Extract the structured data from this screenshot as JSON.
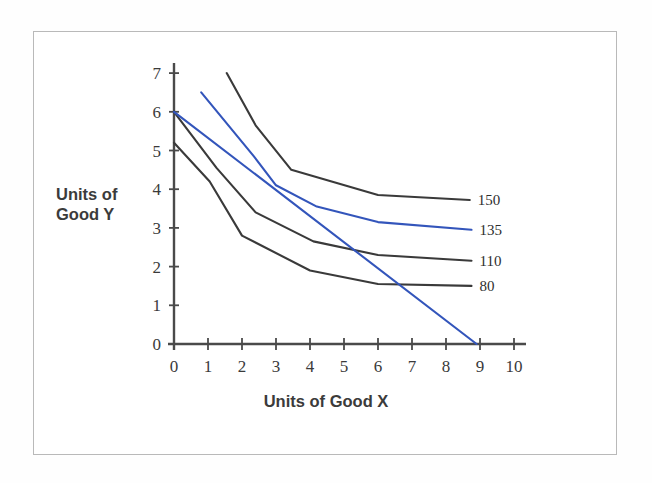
{
  "figure": {
    "background_color": "#ffffff",
    "frame_border_color": "#b9b9b9"
  },
  "chart_data": {
    "type": "line",
    "title": "",
    "xlabel": "Units of Good X",
    "ylabel": "Units of Good Y",
    "xlim": [
      0,
      10
    ],
    "ylim": [
      0,
      7
    ],
    "xticks": [
      0,
      1,
      2,
      3,
      4,
      5,
      6,
      7,
      8,
      9,
      10
    ],
    "xticklabels": [
      "0",
      "1",
      "2",
      "3",
      "4",
      "5",
      "6",
      "7",
      "8",
      "9",
      "10"
    ],
    "yticks": [
      0,
      1,
      2,
      3,
      4,
      5,
      6,
      7
    ],
    "yticklabels": [
      "0",
      "1",
      "2",
      "3",
      "4",
      "5",
      "6",
      "7"
    ],
    "grid": false,
    "legend_position": "right-of-curve-ends",
    "axis_color": "#4a4a4a",
    "series": [
      {
        "name": "150",
        "label": "150",
        "kind": "indifference-curve",
        "color": "#3a3a3a",
        "label_x": 9.0,
        "label_y": 3.85,
        "points": [
          [
            1.55,
            7.0
          ],
          [
            2.4,
            5.65
          ],
          [
            3.45,
            4.5
          ],
          [
            6.0,
            3.85
          ],
          [
            8.7,
            3.72
          ]
        ]
      },
      {
        "name": "135",
        "label": "135",
        "kind": "indifference-curve",
        "color": "#3355bb",
        "label_x": 9.0,
        "label_y": 3.0,
        "points": [
          [
            0.8,
            6.5
          ],
          [
            2.35,
            4.85
          ],
          [
            3.0,
            4.1
          ],
          [
            4.2,
            3.55
          ],
          [
            6.0,
            3.15
          ],
          [
            8.75,
            2.95
          ]
        ]
      },
      {
        "name": "110",
        "label": "110",
        "kind": "indifference-curve",
        "color": "#3a3a3a",
        "label_x": 9.0,
        "label_y": 2.15,
        "points": [
          [
            0.0,
            6.0
          ],
          [
            1.25,
            4.55
          ],
          [
            2.4,
            3.4
          ],
          [
            4.1,
            2.65
          ],
          [
            6.0,
            2.3
          ],
          [
            8.75,
            2.15
          ]
        ]
      },
      {
        "name": "80",
        "label": "80",
        "kind": "indifference-curve",
        "color": "#3a3a3a",
        "label_x": 9.0,
        "label_y": 1.55,
        "points": [
          [
            0.0,
            5.2
          ],
          [
            1.05,
            4.2
          ],
          [
            2.0,
            2.8
          ],
          [
            4.0,
            1.9
          ],
          [
            6.0,
            1.55
          ],
          [
            8.75,
            1.5
          ]
        ]
      },
      {
        "name": "budget-line",
        "label": "",
        "kind": "budget-line",
        "color": "#3355bb",
        "label_x": null,
        "label_y": null,
        "points": [
          [
            0.0,
            6.0
          ],
          [
            8.9,
            0.0
          ]
        ]
      }
    ]
  }
}
